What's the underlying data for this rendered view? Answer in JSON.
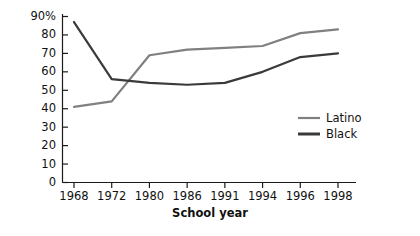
{
  "chart_data": {
    "type": "line",
    "title": "",
    "xlabel": "School year",
    "ylabel": "",
    "categories": [
      "1968",
      "1972",
      "1980",
      "1986",
      "1991",
      "1994",
      "1996",
      "1998"
    ],
    "series": [
      {
        "name": "Latino",
        "color": "#808080",
        "values": [
          41,
          44,
          69,
          72,
          73,
          74,
          81,
          83
        ]
      },
      {
        "name": "Black",
        "color": "#3a3a3a",
        "values": [
          87,
          56,
          54,
          53,
          54,
          60,
          68,
          70
        ]
      }
    ],
    "ylim": [
      0,
      90
    ],
    "ytick_labels": [
      "90%",
      "80",
      "70",
      "60",
      "50",
      "40",
      "30",
      "20",
      "10",
      "0"
    ],
    "ytick_values": [
      90,
      80,
      70,
      60,
      50,
      40,
      30,
      20,
      10,
      0
    ],
    "grid": false,
    "legend_position": "right-middle"
  },
  "legend": {
    "entries": [
      {
        "label": "Latino",
        "color": "#808080"
      },
      {
        "label": "Black",
        "color": "#3a3a3a"
      }
    ]
  },
  "axes": {
    "x_title": "School year"
  }
}
